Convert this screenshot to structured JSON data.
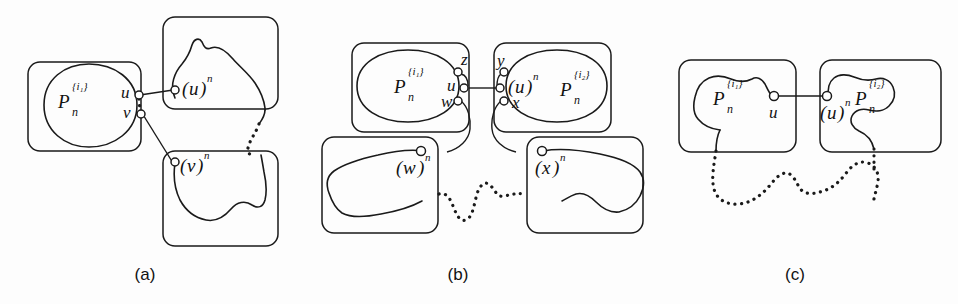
{
  "figure": {
    "width": 958,
    "height": 304,
    "background": "#fdfdfd",
    "ink_color": "#1a1a1a"
  },
  "panels": [
    {
      "id": "a",
      "caption": "(a)",
      "boxes": [
        {
          "name": "box-pn-i1",
          "contains": "P_n^{i_1}"
        },
        {
          "name": "box-u-n",
          "contains": "(u)^n"
        },
        {
          "name": "box-v-n",
          "contains": "(v)^n"
        }
      ],
      "labels": {
        "set_left_base": "P",
        "set_left_sub": "n",
        "set_left_sup": "{i₁}",
        "node_u": "u",
        "node_v": "v",
        "copy_u_open": "(",
        "copy_u_var": "u",
        "copy_u_close": ")",
        "copy_u_sup": "n",
        "copy_v_open": "(",
        "copy_v_var": "v",
        "copy_v_close": ")",
        "copy_v_sup": "n"
      }
    },
    {
      "id": "b",
      "caption": "(b)",
      "boxes": [
        {
          "name": "box-pn-i1",
          "contains": "P_n^{i_1}"
        },
        {
          "name": "box-pn-i2",
          "contains": "P_n^{i_2}"
        },
        {
          "name": "box-w-n",
          "contains": "(w)^n"
        },
        {
          "name": "box-x-n",
          "contains": "(x)^n"
        }
      ],
      "labels": {
        "set_left_base": "P",
        "set_left_sub": "n",
        "set_left_sup": "{i₁}",
        "set_right_base": "P",
        "set_right_sub": "n",
        "set_right_sup": "{i₂}",
        "node_z": "z",
        "node_u": "u",
        "node_w": "w",
        "node_y": "y",
        "node_x": "x",
        "copy_u_open": "(",
        "copy_u_var": "u",
        "copy_u_close": ")",
        "copy_u_sup": "n",
        "copy_w_open": "(",
        "copy_w_var": "w",
        "copy_w_close": ")",
        "copy_w_sup": "n",
        "copy_x_open": "(",
        "copy_x_var": "x",
        "copy_x_close": ")",
        "copy_x_sup": "n"
      }
    },
    {
      "id": "c",
      "caption": "(c)",
      "boxes": [
        {
          "name": "box-pn-i1",
          "contains": "P_n^{i_1}"
        },
        {
          "name": "box-pn-i2",
          "contains": "P_n^{i_2}"
        }
      ],
      "labels": {
        "set_left_base": "P",
        "set_left_sub": "n",
        "set_left_sup": "{i₁}",
        "set_right_base": "P",
        "set_right_sub": "n",
        "set_right_sup": "{i₂}",
        "node_u": "u",
        "copy_u_open": "(",
        "copy_u_var": "u",
        "copy_u_close": ")",
        "copy_u_sup": "n"
      }
    }
  ]
}
